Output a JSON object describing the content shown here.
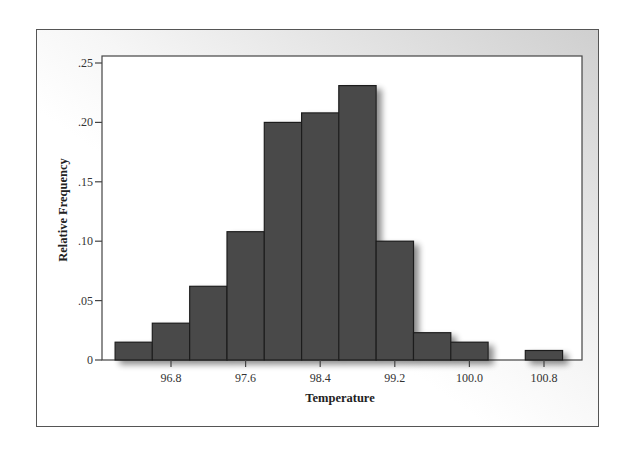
{
  "chart_data": {
    "type": "bar",
    "subtype": "histogram",
    "title": "",
    "xlabel": "Temperature",
    "ylabel": "Relative Frequency",
    "x_ticks": [
      96.8,
      97.6,
      98.4,
      99.2,
      100.0,
      100.8
    ],
    "x_tick_labels": [
      "96.8",
      "97.6",
      "98.4",
      "99.2",
      "100.0",
      "100.8"
    ],
    "y_ticks": [
      0,
      0.05,
      0.1,
      0.15,
      0.2,
      0.25
    ],
    "y_tick_labels": [
      "0",
      ".05",
      ".10",
      ".15",
      ".20",
      ".25"
    ],
    "ylim": [
      0,
      0.25
    ],
    "bin_width": 0.4,
    "bin_starts": [
      96.2,
      96.6,
      97.0,
      97.4,
      97.8,
      98.2,
      98.6,
      99.0,
      99.4,
      99.8,
      100.2,
      100.6
    ],
    "categories": [
      "96.4",
      "96.8",
      "97.2",
      "97.6",
      "98.0",
      "98.4",
      "98.8",
      "99.2",
      "99.6",
      "100.0",
      "100.4",
      "100.8"
    ],
    "values": [
      0.015,
      0.031,
      0.062,
      0.108,
      0.2,
      0.208,
      0.231,
      0.1,
      0.023,
      0.015,
      0.0,
      0.008
    ],
    "grid": false,
    "legend": null
  },
  "colors": {
    "bar_fill": "#4a4a4a",
    "bar_edge": "#1e1e1e",
    "axis": "#444444",
    "frame_gradient_dark": "#cfcfcf",
    "plot_bg": "#ffffff"
  }
}
